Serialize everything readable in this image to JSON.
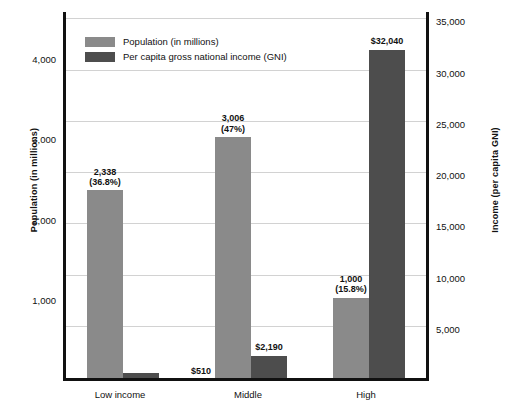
{
  "chart_data": {
    "type": "bar",
    "title": "",
    "categories": [
      "Low income",
      "Middle",
      "High"
    ],
    "series": [
      {
        "name": "Population (in millions)",
        "axis": "left",
        "color": "#8a8a8a",
        "values": [
          2338,
          3006,
          1000
        ],
        "labels": [
          "2,338\n(36.8%)",
          "3,006\n(47%)",
          "1,000\n(15.8%)"
        ],
        "label_lines": [
          [
            "2,338",
            "(36.8%)"
          ],
          [
            "3,006",
            "(47%)"
          ],
          [
            "1,000",
            "(15.8%)"
          ]
        ]
      },
      {
        "name": "Per capita gross national income (GNI)",
        "axis": "right",
        "color": "#4d4d4d",
        "values": [
          510,
          2190,
          32040
        ],
        "labels": [
          "$510",
          "$2,190",
          "$32,040"
        ]
      }
    ],
    "xlabel": "",
    "ylabel": "Population (in millions)",
    "y2label": "Income (per capita GNI)",
    "ylim": [
      0,
      4600
    ],
    "y2lim": [
      0,
      36000
    ],
    "yticks": [
      "1,000",
      "2,000",
      "3,000",
      "4,000"
    ],
    "ytick_values": [
      1000,
      2000,
      3000,
      4000
    ],
    "y2ticks": [
      "5,000",
      "10,000",
      "15,000",
      "20,000",
      "25,000",
      "30,000",
      "35,000"
    ],
    "y2tick_values": [
      5000,
      10000,
      15000,
      20000,
      25000,
      30000,
      35000
    ],
    "grid": true,
    "legend_position": "top-left"
  },
  "axes": {
    "left_title": "Population (in millions)",
    "right_title": "Income (per capita GNI)"
  },
  "legend": {
    "items": [
      {
        "label": "Population (in millions)",
        "color": "#8a8a8a"
      },
      {
        "label": "Per capita gross national income (GNI)",
        "color": "#4d4d4d"
      }
    ]
  }
}
